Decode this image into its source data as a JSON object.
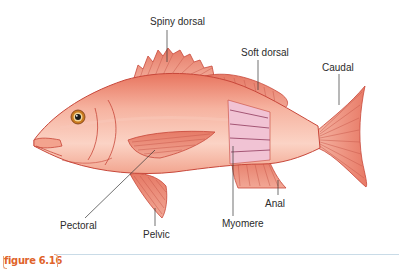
{
  "figure": {
    "tag": "figure 6.16",
    "accent_color": "#e0632a",
    "rule_color": "#c9dbe7"
  },
  "diagram": {
    "colors": {
      "body": "#f4a38c",
      "body_light": "#fbd6c8",
      "outline": "#c8473a",
      "fin": "#e98a78",
      "fin_ray": "#c95a4c",
      "myomere": "#f1c3d4",
      "myomere_line": "#9b4a6a",
      "eye_ring": "#c97a1e",
      "leader_line": "#333333"
    },
    "labels": [
      {
        "id": "spiny-dorsal",
        "text": "Spiny dorsal"
      },
      {
        "id": "soft-dorsal",
        "text": "Soft dorsal"
      },
      {
        "id": "caudal",
        "text": "Caudal"
      },
      {
        "id": "pectoral",
        "text": "Pectoral"
      },
      {
        "id": "pelvic",
        "text": "Pelvic"
      },
      {
        "id": "myomere",
        "text": "Myomere"
      },
      {
        "id": "anal",
        "text": "Anal"
      }
    ]
  }
}
